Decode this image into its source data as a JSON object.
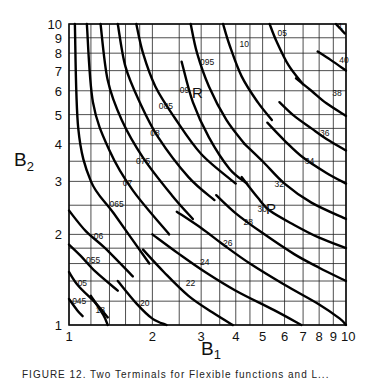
{
  "chart_data": {
    "type": "line",
    "subtype": "contour",
    "title": "",
    "xlabel": "B1",
    "ylabel": "B2",
    "xscale": "log",
    "yscale": "log",
    "xlim": [
      1,
      10
    ],
    "ylim": [
      1,
      10
    ],
    "grid": true,
    "x_tick_labels": [
      "1",
      "2",
      "3",
      "4",
      "5",
      "6",
      "7",
      "8",
      "9",
      "10"
    ],
    "x_ticks": [
      1,
      2,
      3,
      4,
      5,
      6,
      7,
      8,
      9,
      10
    ],
    "y_tick_labels": [
      "1",
      "2",
      "3",
      "4",
      "5",
      "6",
      "7",
      "8",
      "9",
      "10"
    ],
    "y_ticks": [
      1,
      2,
      3,
      4,
      5,
      6,
      7,
      8,
      9,
      10
    ],
    "x_gridlines": [
      1,
      1.2,
      1.4,
      1.6,
      1.8,
      2,
      2.5,
      3,
      3.5,
      4,
      4.5,
      5,
      6,
      7,
      8,
      9,
      10
    ],
    "y_gridlines": [
      1,
      1.2,
      1.4,
      1.6,
      1.8,
      2,
      2.5,
      3,
      3.5,
      4,
      4.5,
      5,
      6,
      7,
      8,
      9,
      10
    ],
    "region_labels": [
      {
        "text": "R",
        "x": 2.25,
        "y": 6.1
      },
      {
        "text": "P",
        "x": 5.45,
        "y": 2.05
      }
    ],
    "families": [
      {
        "name": "R family",
        "series": [
          {
            "label": "045",
            "points": [
              [
                1.0,
                1.22
              ],
              [
                1.07,
                1.12
              ],
              [
                1.12,
                1.07
              ]
            ],
            "label_at": [
              1.07,
              1.2
            ]
          },
          {
            "label": "05",
            "points": [
              [
                1.0,
                1.5
              ],
              [
                1.08,
                1.35
              ],
              [
                1.25,
                1.18
              ],
              [
                1.38,
                1.06
              ]
            ],
            "label_at": [
              1.12,
              1.38
            ]
          },
          {
            "label": "055",
            "points": [
              [
                1.0,
                1.85
              ],
              [
                1.1,
                1.7
              ],
              [
                1.25,
                1.5
              ],
              [
                1.5,
                1.3
              ]
            ],
            "label_at": [
              1.2,
              1.65
            ]
          },
          {
            "label": "06",
            "points": [
              [
                1.0,
                2.4
              ],
              [
                1.15,
                2.05
              ],
              [
                1.35,
                1.8
              ],
              [
                1.7,
                1.45
              ]
            ],
            "label_at": [
              1.28,
              1.97
            ]
          },
          {
            "label": "065",
            "points": [
              [
                1.05,
                10
              ],
              [
                1.08,
                4.5
              ],
              [
                1.2,
                3.0
              ],
              [
                1.45,
                2.35
              ],
              [
                1.95,
                1.6
              ]
            ],
            "label_at": [
              1.46,
              2.52
            ]
          },
          {
            "label": "07",
            "points": [
              [
                1.16,
                10
              ],
              [
                1.22,
                5.5
              ],
              [
                1.4,
                3.8
              ],
              [
                1.7,
                2.8
              ],
              [
                2.3,
                2.0
              ]
            ],
            "label_at": [
              1.63,
              2.96
            ]
          },
          {
            "label": "075",
            "points": [
              [
                1.3,
                10
              ],
              [
                1.38,
                6.5
              ],
              [
                1.55,
                4.8
              ],
              [
                1.85,
                3.6
              ],
              [
                2.35,
                2.7
              ],
              [
                2.8,
                2.25
              ]
            ],
            "label_at": [
              1.82,
              3.5
            ]
          },
          {
            "label": "08",
            "points": [
              [
                1.5,
                10
              ],
              [
                1.6,
                7.2
              ],
              [
                1.8,
                5.5
              ],
              [
                2.1,
                4.2
              ],
              [
                2.7,
                3.1
              ],
              [
                3.35,
                2.6
              ]
            ],
            "label_at": [
              2.05,
              4.35
            ]
          },
          {
            "label": "085",
            "points": [
              [
                1.75,
                10
              ],
              [
                1.85,
                8.0
              ],
              [
                2.05,
                6.2
              ],
              [
                2.4,
                4.9
              ],
              [
                3.0,
                3.7
              ],
              [
                4.0,
                2.95
              ]
            ],
            "label_at": [
              2.2,
              5.35
            ]
          },
          {
            "label": "09",
            "points": [
              [
                2.55,
                7.5
              ],
              [
                2.8,
                5.5
              ],
              [
                3.2,
                4.2
              ],
              [
                3.8,
                3.3
              ],
              [
                4.4,
                2.95
              ]
            ],
            "label_at": [
              2.62,
              6.05
            ]
          },
          {
            "label": "095",
            "points": [
              [
                2.75,
                10
              ],
              [
                2.9,
                8.0
              ],
              [
                3.2,
                6.2
              ],
              [
                3.7,
                4.8
              ],
              [
                4.3,
                4.0
              ]
            ],
            "label_at": [
              3.1,
              7.5
            ]
          },
          {
            "label": "10",
            "points": [
              [
                3.6,
                10
              ],
              [
                3.8,
                8.5
              ],
              [
                4.2,
                6.7
              ],
              [
                4.8,
                5.5
              ],
              [
                5.4,
                4.8
              ]
            ],
            "label_at": [
              4.3,
              8.6
            ]
          },
          {
            "label": "05",
            "points": [
              [
                5.3,
                10
              ],
              [
                5.6,
                8.8
              ],
              [
                6.2,
                7.3
              ],
              [
                7.0,
                6.3
              ]
            ],
            "label_at": [
              5.9,
              9.3
            ]
          },
          {
            "label": "1",
            "points": [
              [
                9.2,
                10
              ],
              [
                9.6,
                9.6
              ],
              [
                9.9,
                9.3
              ]
            ],
            "label_at": [
              9.75,
              9.85
            ]
          }
        ]
      },
      {
        "name": "P family",
        "series": [
          {
            "label": "18",
            "points": [
              [
                1.2,
                1.25
              ],
              [
                1.33,
                1.08
              ],
              [
                1.38,
                1.0
              ]
            ],
            "label_at": [
              1.3,
              1.12
            ]
          },
          {
            "label": "20",
            "points": [
              [
                1.5,
                1.4
              ],
              [
                1.75,
                1.18
              ],
              [
                2.0,
                1.05
              ],
              [
                2.25,
                1.0
              ]
            ],
            "label_at": [
              1.88,
              1.18
            ]
          },
          {
            "label": "22",
            "points": [
              [
                1.85,
                1.78
              ],
              [
                2.2,
                1.5
              ],
              [
                2.7,
                1.25
              ],
              [
                3.3,
                1.1
              ],
              [
                3.9,
                1.0
              ]
            ],
            "label_at": [
              2.75,
              1.38
            ]
          },
          {
            "label": "24",
            "points": [
              [
                2.0,
                2.0
              ],
              [
                2.5,
                1.72
              ],
              [
                3.1,
                1.5
              ],
              [
                4.0,
                1.3
              ],
              [
                5.5,
                1.12
              ],
              [
                6.9,
                1.0
              ]
            ],
            "label_at": [
              3.1,
              1.62
            ]
          },
          {
            "label": "26",
            "points": [
              [
                2.45,
                2.38
              ],
              [
                3.0,
                2.1
              ],
              [
                3.6,
                1.85
              ],
              [
                4.5,
                1.6
              ],
              [
                6.0,
                1.36
              ],
              [
                8.0,
                1.17
              ],
              [
                9.5,
                1.05
              ],
              [
                10,
                1.0
              ]
            ],
            "label_at": [
              3.75,
              1.87
            ]
          },
          {
            "label": "28",
            "points": [
              [
                3.4,
                2.7
              ],
              [
                4.0,
                2.35
              ],
              [
                5.0,
                2.02
              ],
              [
                6.5,
                1.72
              ],
              [
                8.0,
                1.55
              ],
              [
                10,
                1.4
              ]
            ],
            "label_at": [
              4.45,
              2.2
            ]
          },
          {
            "label": "30",
            "points": [
              [
                4.2,
                3.1
              ],
              [
                4.8,
                2.65
              ],
              [
                5.3,
                2.4
              ],
              [
                6.5,
                2.15
              ],
              [
                8.0,
                1.95
              ],
              [
                10,
                1.8
              ]
            ],
            "label_at": [
              5.0,
              2.43
            ]
          },
          {
            "label": "32",
            "points": [
              [
                4.3,
                4.0
              ],
              [
                5.0,
                3.5
              ],
              [
                6.0,
                2.95
              ],
              [
                7.5,
                2.55
              ],
              [
                10,
                2.25
              ]
            ],
            "label_at": [
              5.75,
              2.95
            ]
          },
          {
            "label": "34",
            "points": [
              [
                5.2,
                4.7
              ],
              [
                6.0,
                4.1
              ],
              [
                7.0,
                3.6
              ],
              [
                8.5,
                3.2
              ],
              [
                10,
                2.95
              ]
            ],
            "label_at": [
              7.4,
              3.5
            ]
          },
          {
            "label": "36",
            "points": [
              [
                5.75,
                5.5
              ],
              [
                6.5,
                4.95
              ],
              [
                7.5,
                4.5
              ],
              [
                8.5,
                4.15
              ],
              [
                10,
                3.8
              ]
            ],
            "label_at": [
              8.4,
              4.35
            ]
          },
          {
            "label": "38",
            "points": [
              [
                6.6,
                6.6
              ],
              [
                7.5,
                6.0
              ],
              [
                8.5,
                5.45
              ],
              [
                10,
                4.95
              ]
            ],
            "label_at": [
              9.3,
              5.9
            ]
          },
          {
            "label": "40",
            "points": [
              [
                7.9,
                8.1
              ],
              [
                8.8,
                7.6
              ],
              [
                10,
                7.0
              ]
            ],
            "label_at": [
              9.85,
              7.6
            ]
          }
        ]
      }
    ]
  },
  "chart": {
    "xlabel_main": "B",
    "xlabel_sub": "1",
    "ylabel_main": "B",
    "ylabel_sub": "2",
    "region_R": "R",
    "region_P": "P"
  },
  "caption": "FIGURE 12. Two Terminals for Flexible functions and L..."
}
